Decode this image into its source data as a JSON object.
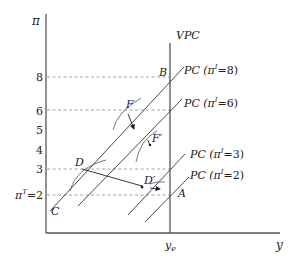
{
  "axes": {
    "y_label": "π",
    "x_label": "y",
    "x_tick": "y",
    "x_tick_sub": "e",
    "y_ticks": [
      {
        "label": "8",
        "y": 77
      },
      {
        "label": "6",
        "y": 111
      },
      {
        "label": "5",
        "y": 130
      },
      {
        "label": "4",
        "y": 150
      },
      {
        "label": "3",
        "y": 169
      }
    ],
    "target_tick": {
      "prefix": "π",
      "sup": "T",
      "suffix": "=2"
    }
  },
  "curves": {
    "vpc": "VPC",
    "pc8": {
      "pre": "PC (π",
      "sup": "I",
      "post": "=8)"
    },
    "pc6": {
      "pre": "PC (π",
      "sup": "I",
      "post": "=6)"
    },
    "pc3": {
      "pre": "PC (π",
      "sup": "I",
      "post": "=3)"
    },
    "pc2": {
      "pre": "PC (π",
      "sup": "I",
      "post": "=2)"
    }
  },
  "points": {
    "A": "A",
    "B": "B",
    "C": "C",
    "D": "D",
    "D_prime": "D′",
    "F": "F",
    "F_prime": "F′"
  }
}
